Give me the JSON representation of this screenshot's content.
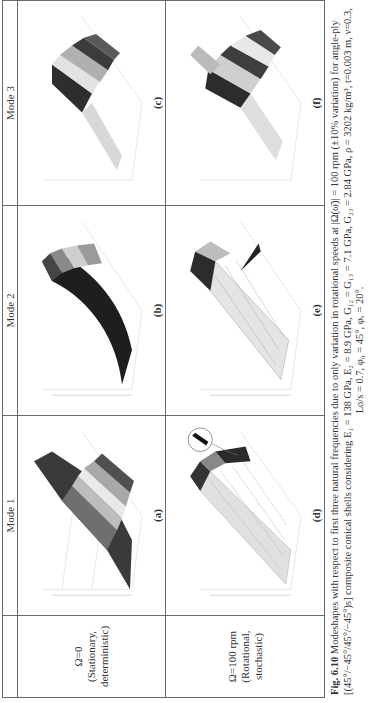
{
  "figure": {
    "orientation": "rotated-90-ccw",
    "columns": [
      "",
      "Mode 1",
      "Mode 2",
      "Mode 3"
    ],
    "rows": [
      {
        "label": "Ω=0 (Stationary, deterministic)",
        "label_lines": [
          "Ω=0 (Stationary,",
          "deterministic)"
        ],
        "panels": [
          {
            "id": "a",
            "label": "(a)",
            "mode": "Mode 1"
          },
          {
            "id": "b",
            "label": "(b)",
            "mode": "Mode 2"
          },
          {
            "id": "c",
            "label": "(c)",
            "mode": "Mode 3"
          }
        ]
      },
      {
        "label": "Ω=100 rpm (Rotational, stochastic)",
        "label_lines": [
          "Ω=100 rpm",
          "(Rotational,",
          "stochastic)"
        ],
        "panels": [
          {
            "id": "d",
            "label": "(d)",
            "mode": "Mode 1"
          },
          {
            "id": "e",
            "label": "(e)",
            "mode": "Mode 2"
          },
          {
            "id": "f",
            "label": "(f)",
            "mode": "Mode 3"
          }
        ]
      }
    ]
  },
  "caption": {
    "fig_number": "Fig. 6.10",
    "line1": "Modeshapes with respect to first three natural frequencies due to only variation in rotational speeds at |Ω(ω̄)| = 100 rpm (±10% variation) for angle-ply",
    "line2": "[(45°/−45°/45°/−45°)s] composite conical shells considering E₁ = 138 GPa, E₂ = 8.9 GPa, G₁₂ = G₁₃ = 7.1 GPa, G₂₃ = 2.84 GPa, ρ = 3202 kg/m³, t=0.003 m, ν=0.3,",
    "line3": "Lo/s = 0.7, φ₀ = 45°, φᵥ = 20°."
  },
  "colors": {
    "border": "#6a6a6a",
    "text": "#333333",
    "surface_dark": "#2b2b2b",
    "surface_light": "#e6e6e6"
  }
}
